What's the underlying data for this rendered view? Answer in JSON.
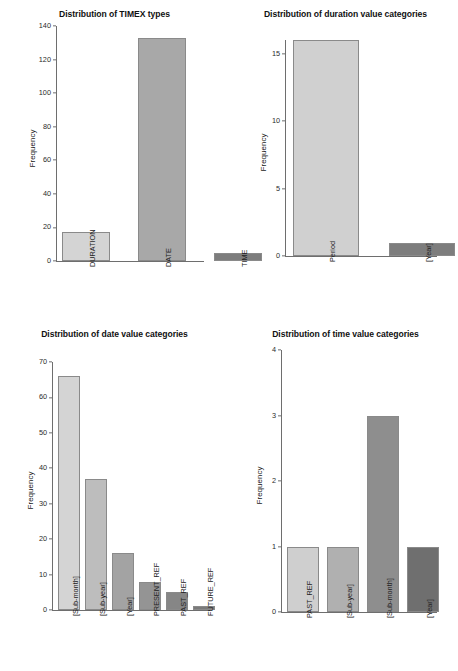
{
  "figure": {
    "background": "#ffffff",
    "ylabel": "Frequency",
    "axis_color": "#6e6e6e",
    "panels": 4
  },
  "palette": {
    "gray1": "#d4d4d4",
    "gray2": "#b3b3b3",
    "gray3": "#9a9a9a",
    "gray4": "#8c8c8c",
    "gray5": "#7d7d7d",
    "gray6": "#6f6f6f",
    "border": "#8a8a8a"
  },
  "chart_data": [
    {
      "type": "bar",
      "title": "Distribution of TIMEX types",
      "xlabel": "",
      "ylabel": "Frequency",
      "categories": [
        "DURATION",
        "DATE",
        "TIME"
      ],
      "values": [
        17,
        133,
        5
      ],
      "yticks": [
        0,
        20,
        40,
        60,
        80,
        100,
        120,
        140
      ],
      "ylim": [
        0,
        140
      ],
      "grid": false,
      "legend": "none",
      "bar_colors": [
        "#d4d4d4",
        "#a8a8a8",
        "#7d7d7d"
      ]
    },
    {
      "type": "bar",
      "title": "Distribution of duration value categories",
      "xlabel": "",
      "ylabel": "Frequency",
      "categories": [
        "Period",
        "[Year]"
      ],
      "values": [
        16,
        1
      ],
      "yticks": [
        0,
        5,
        10,
        15
      ],
      "ylim": [
        0,
        16
      ],
      "grid": false,
      "legend": "none",
      "bar_colors": [
        "#d0d0d0",
        "#7d7d7d"
      ]
    },
    {
      "type": "bar",
      "title": "Distribution of date value categories",
      "xlabel": "",
      "ylabel": "Frequency",
      "categories": [
        "[Sub-month]",
        "[Sub-year]",
        "[Year]",
        "PRESENT_REF",
        "PAST_REF",
        "FUTURE_REF"
      ],
      "values": [
        66,
        37,
        16,
        8,
        5,
        1
      ],
      "yticks": [
        0,
        10,
        20,
        30,
        40,
        50,
        60,
        70
      ],
      "ylim": [
        0,
        70
      ],
      "grid": false,
      "legend": "none",
      "bar_colors": [
        "#d4d4d4",
        "#bdbdbd",
        "#a3a3a3",
        "#949494",
        "#868686",
        "#7a7a7a"
      ]
    },
    {
      "type": "bar",
      "title": "Distribution of time value categories",
      "xlabel": "",
      "ylabel": "Frequency",
      "categories": [
        "PAST_REF",
        "[Sub-year]",
        "[Sub-month]",
        "[Year]"
      ],
      "values": [
        1,
        1,
        3,
        1
      ],
      "yticks": [
        0,
        1,
        2,
        3,
        4
      ],
      "ylim": [
        0,
        4
      ],
      "grid": false,
      "legend": "none",
      "bar_colors": [
        "#cfcfcf",
        "#b0b0b0",
        "#8e8e8e",
        "#6f6f6f"
      ]
    }
  ]
}
